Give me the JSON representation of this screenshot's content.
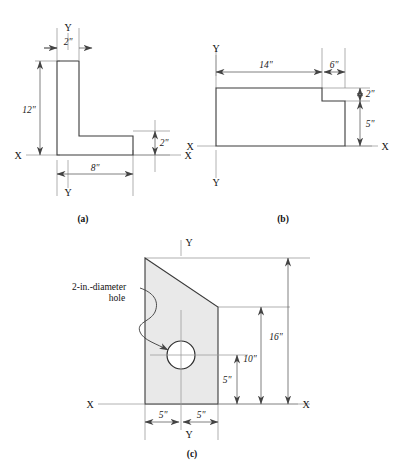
{
  "document": {
    "type": "engineering-cross-section-figure-set",
    "figure_count": 3,
    "colors": {
      "section_fill": "#e9e9e9",
      "outline": "#3a3a3a",
      "dimension": "#555555",
      "extension": "#8e8e8e",
      "hole_fill": "#ffffff",
      "background": "#ffffff"
    }
  },
  "figures": {
    "a": {
      "caption": "(a)",
      "shape": "angle-L-section",
      "axes": {
        "x_left_label": "X",
        "x_right_label": "X",
        "y_top_label": "Y",
        "y_bottom_label": "Y"
      },
      "dimensions": [
        {
          "name": "flange-width",
          "value": "2\"",
          "orientation": "horizontal"
        },
        {
          "name": "overall-height",
          "value": "12\"",
          "orientation": "vertical"
        },
        {
          "name": "overall-width",
          "value": "8\"",
          "orientation": "horizontal"
        },
        {
          "name": "base-thickness",
          "value": "2\"",
          "orientation": "vertical"
        }
      ]
    },
    "b": {
      "caption": "(b)",
      "shape": "stepped-rectangular-section",
      "axes": {
        "x_left_label": "X",
        "x_right_label": "X",
        "y_top_label": "Y",
        "y_bottom_label": "Y"
      },
      "dimensions": [
        {
          "name": "left-segment-width",
          "value": "14\"",
          "orientation": "horizontal"
        },
        {
          "name": "right-segment-width",
          "value": "6\"",
          "orientation": "horizontal"
        },
        {
          "name": "step-height",
          "value": "2\"",
          "orientation": "vertical"
        },
        {
          "name": "lower-height",
          "value": "5\"",
          "orientation": "vertical"
        }
      ]
    },
    "c": {
      "caption": "(c)",
      "shape": "trapezoidal-section-with-hole",
      "axes": {
        "x_left_label": "X",
        "x_right_label": "X",
        "y_top_label": "Y",
        "y_bottom_label": "Y"
      },
      "annotation": {
        "name": "hole-callout",
        "line1": "2-in.-diameter",
        "line2": "hole"
      },
      "dimensions": [
        {
          "name": "overall-height",
          "value": "16\"",
          "orientation": "vertical"
        },
        {
          "name": "right-edge-height",
          "value": "10\"",
          "orientation": "vertical"
        },
        {
          "name": "hole-center-height",
          "value": "5\"",
          "orientation": "vertical"
        },
        {
          "name": "left-half-width",
          "value": "5\"",
          "orientation": "horizontal"
        },
        {
          "name": "right-half-width",
          "value": "5\"",
          "orientation": "horizontal"
        }
      ]
    }
  }
}
